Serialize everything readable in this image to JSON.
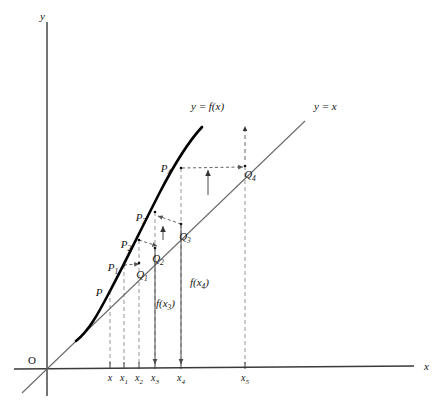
{
  "figure": {
    "background_color": "#ffffff",
    "ink_color": "#151515",
    "curve_color": "#000000",
    "line_color": "#6a6a6a",
    "dash_color": "#8a8a8a"
  },
  "axes": {
    "x_label": "x",
    "y_label": "y",
    "origin_label": "O",
    "x_axis": {
      "x1": 14,
      "y1": 369,
      "x2": 414,
      "y2": 366
    },
    "y_axis": {
      "x1": 47,
      "y1": 22,
      "x2": 47,
      "y2": 396
    },
    "x_label_pos": {
      "x": 424,
      "y": 370
    },
    "y_label_pos": {
      "x": 40,
      "y": 20
    },
    "origin_pos": {
      "x": 28,
      "y": 364
    }
  },
  "ticks": [
    {
      "label": "x",
      "sub": "",
      "x": 110,
      "y": 367,
      "label_x": 110,
      "label_y": 381
    },
    {
      "label": "x",
      "sub": "1",
      "x": 124,
      "y": 367,
      "label_x": 124,
      "label_y": 381
    },
    {
      "label": "x",
      "sub": "2",
      "x": 139,
      "y": 367,
      "label_x": 139,
      "label_y": 381
    },
    {
      "label": "x",
      "sub": "3",
      "x": 155,
      "y": 367,
      "label_x": 155,
      "label_y": 381
    },
    {
      "label": "x",
      "sub": "4",
      "x": 181,
      "y": 367,
      "label_x": 181,
      "label_y": 381
    },
    {
      "label": "x",
      "sub": "5",
      "x": 245,
      "y": 367,
      "label_x": 245,
      "label_y": 381
    }
  ],
  "curve": {
    "name": "y = f(x)",
    "label": "y = f(x)",
    "label_pos": {
      "x": 191,
      "y": 110
    },
    "path": "M 76 341 C 90 330 100 310 110 291 C 124 265 140 231 160 192 C 175 163 190 140 202 127"
  },
  "identity_line": {
    "name": "y = x",
    "label": "y = x",
    "label_pos": {
      "x": 314,
      "y": 110
    },
    "segment": {
      "x1": 22,
      "y1": 393,
      "x2": 305,
      "y2": 121
    }
  },
  "points": [
    {
      "id": "P",
      "base": "P",
      "sub": "",
      "x": 110,
      "y": 291,
      "label_x": 99,
      "label_y": 296
    },
    {
      "id": "P1",
      "base": "P",
      "sub": "1",
      "x": 124,
      "y": 265,
      "label_x": 113,
      "label_y": 271
    },
    {
      "id": "P2",
      "base": "P",
      "sub": "2",
      "x": 139,
      "y": 240,
      "label_x": 126,
      "label_y": 248
    },
    {
      "id": "P3",
      "base": "P",
      "sub": "3",
      "x": 155,
      "y": 212,
      "label_x": 141,
      "label_y": 221
    },
    {
      "id": "P4",
      "base": "P",
      "sub": "4",
      "x": 181,
      "y": 168,
      "label_x": 166,
      "label_y": 172
    },
    {
      "id": "Q1",
      "base": "Q",
      "sub": "1",
      "x": 139,
      "y": 263,
      "label_x": 142,
      "label_y": 278
    },
    {
      "id": "Q2",
      "base": "Q",
      "sub": "2",
      "x": 155,
      "y": 248,
      "label_x": 158,
      "label_y": 262
    },
    {
      "id": "Q3",
      "base": "Q",
      "sub": "3",
      "x": 181,
      "y": 224,
      "label_x": 185,
      "label_y": 240
    },
    {
      "id": "Q4",
      "base": "Q",
      "sub": "4",
      "x": 245,
      "y": 166,
      "label_x": 250,
      "label_y": 178
    }
  ],
  "value_labels": [
    {
      "id": "fx3",
      "text": "f(x",
      "sub": "3",
      "tail": ")",
      "x": 156,
      "y": 307
    },
    {
      "id": "fx4",
      "text": "f(x",
      "sub": "4",
      "tail": ")",
      "x": 190,
      "y": 286
    }
  ],
  "annotations": {
    "horizontal_arrows": [
      {
        "from": "P1",
        "to": "Q1",
        "x1": 124,
        "y1": 265,
        "x2": 139,
        "y2": 264
      },
      {
        "from": "P2",
        "to": "Q2",
        "x1": 139,
        "y1": 240,
        "x2": 157,
        "y2": 246
      },
      {
        "from": "P3",
        "to": "Q3",
        "x1": 181,
        "y1": 224,
        "x2": 158,
        "y2": 216
      },
      {
        "from": "P4",
        "to": "Q4",
        "x1": 182,
        "y1": 168,
        "x2": 243,
        "y2": 167
      }
    ],
    "vertical_up_arrows": [
      {
        "x": 163,
        "y1": 240,
        "y2": 226
      },
      {
        "x": 208,
        "y1": 195,
        "y2": 170
      },
      {
        "x": 245,
        "y1": 160,
        "y2": 126
      }
    ],
    "vertical_down_arrows": [
      {
        "x": 155,
        "y1": 248,
        "y2": 364
      },
      {
        "x": 181,
        "y1": 224,
        "y2": 364
      }
    ],
    "dashed_verticals": [
      {
        "x": 110,
        "y1": 291,
        "y2": 364
      },
      {
        "x": 124,
        "y1": 265,
        "y2": 364
      },
      {
        "x": 139,
        "y1": 240,
        "y2": 364
      },
      {
        "x": 155,
        "y1": 212,
        "y2": 364
      },
      {
        "x": 181,
        "y1": 168,
        "y2": 364
      },
      {
        "x": 245,
        "y1": 166,
        "y2": 364
      }
    ]
  }
}
